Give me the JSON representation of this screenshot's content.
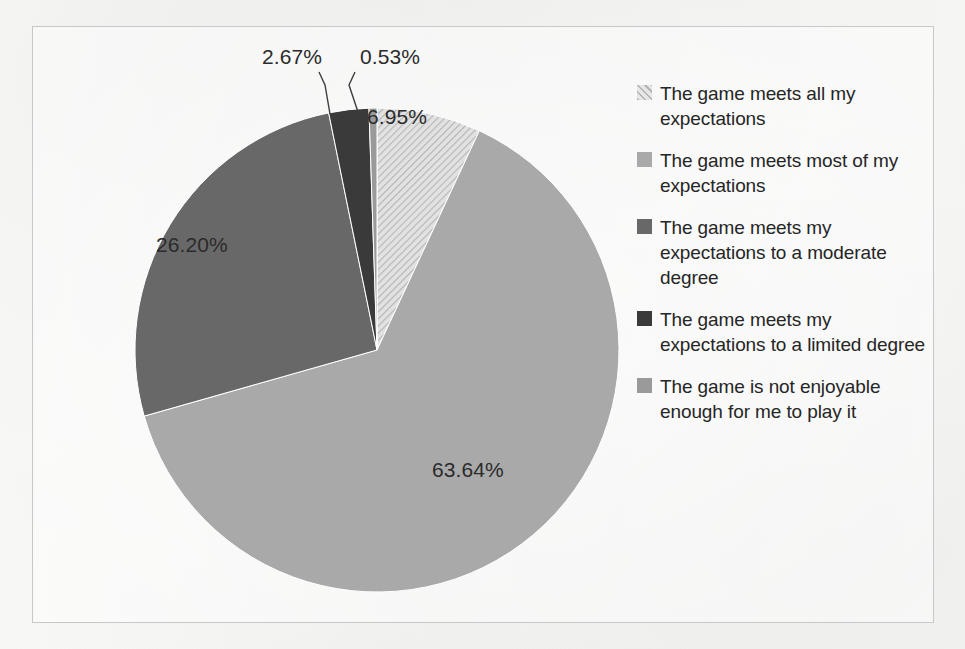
{
  "chart_data": {
    "type": "pie",
    "title": "",
    "subtitle": "",
    "xlabel": "",
    "ylabel": "",
    "grid": false,
    "legend_position": "right",
    "start_angle_deg": 0,
    "direction": "clockwise",
    "categories": [
      "The game meets all my expectations",
      "The game meets most of my expectations",
      "The game meets my expectations to a moderate degree",
      "The game meets my expectations to a limited degree",
      "The game is not enjoyable enough for me to play it"
    ],
    "values": [
      6.95,
      63.64,
      26.2,
      2.67,
      0.53
    ],
    "value_labels": [
      "6.95%",
      "63.64%",
      "26.20%",
      "2.67%",
      "0.53%"
    ],
    "units": "percent",
    "colors": [
      "#d4d4d4",
      "#a9a9a9",
      "#686868",
      "#3a3a3a",
      "#9a9a9a"
    ],
    "fill_patterns": [
      "diagonal-hatch",
      "solid",
      "solid",
      "solid",
      "solid"
    ]
  },
  "pie": {
    "labels": [
      {
        "text": "6.95%",
        "left": 334,
        "top": 78,
        "leader": false
      },
      {
        "text": "63.64%",
        "left": 399,
        "top": 431,
        "leader": false
      },
      {
        "text": "26.20%",
        "left": 123,
        "top": 206,
        "leader": false
      },
      {
        "text": "2.67%",
        "left": 229,
        "top": 18,
        "leader": true
      },
      {
        "text": "0.53%",
        "left": 327,
        "top": 18,
        "leader": true
      }
    ]
  },
  "legend": {
    "items": [
      {
        "label": "The game meets all my expectations",
        "color": "#d4d4d4",
        "pattern": "diagonal-hatch"
      },
      {
        "label": "The game meets most of my expectations",
        "color": "#a9a9a9",
        "pattern": "solid"
      },
      {
        "label": "The game meets my expectations to a moderate degree",
        "color": "#686868",
        "pattern": "solid"
      },
      {
        "label": "The game meets my expectations to a limited degree",
        "color": "#3a3a3a",
        "pattern": "solid"
      },
      {
        "label": "The game is not enjoyable enough for me to play it",
        "color": "#9a9a9a",
        "pattern": "solid"
      }
    ]
  }
}
